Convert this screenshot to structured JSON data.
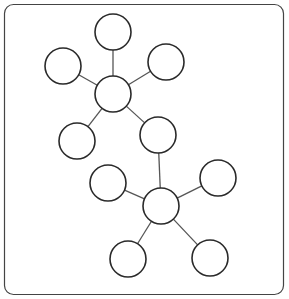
{
  "diagram": {
    "type": "web-diagram",
    "stroke_color": "#2a2a2a",
    "edge_color": "#555555",
    "frame_color": "#444444",
    "nodes": [
      {
        "id": "hub1",
        "label": ""
      },
      {
        "id": "n1-top",
        "label": ""
      },
      {
        "id": "n1-left",
        "label": ""
      },
      {
        "id": "n1-right",
        "label": ""
      },
      {
        "id": "n1-lower-left",
        "label": ""
      },
      {
        "id": "n1-lower-right",
        "label": ""
      },
      {
        "id": "hub2",
        "label": ""
      },
      {
        "id": "n2-upper-left",
        "label": ""
      },
      {
        "id": "n2-upper-right",
        "label": ""
      },
      {
        "id": "n2-bottom-left",
        "label": ""
      },
      {
        "id": "n2-bottom-right",
        "label": ""
      }
    ],
    "edges": [
      [
        "hub1",
        "n1-top"
      ],
      [
        "hub1",
        "n1-left"
      ],
      [
        "hub1",
        "n1-right"
      ],
      [
        "hub1",
        "n1-lower-left"
      ],
      [
        "hub1",
        "n1-lower-right"
      ],
      [
        "n1-lower-right",
        "hub2"
      ],
      [
        "hub2",
        "n2-upper-left"
      ],
      [
        "hub2",
        "n2-upper-right"
      ],
      [
        "hub2",
        "n2-bottom-left"
      ],
      [
        "hub2",
        "n2-bottom-right"
      ]
    ]
  }
}
